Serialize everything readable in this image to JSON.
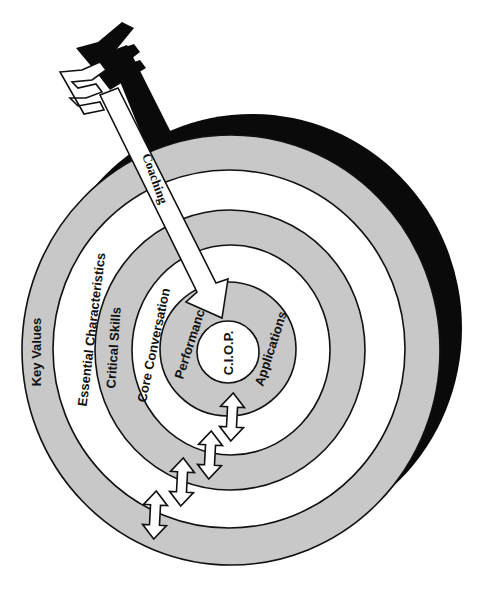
{
  "diagram": {
    "type": "target / bullseye",
    "colors": {
      "ring_gray": "#c8c8c8",
      "ring_white": "#ffffff",
      "outline": "#111111",
      "shadow": "#0a0a0a",
      "background": "#ffffff"
    },
    "rings": [
      {
        "label": "Key Values",
        "fill": "gray"
      },
      {
        "label": "Essential Characteristics",
        "fill": "white"
      },
      {
        "label": "Critical Skills",
        "fill": "gray"
      },
      {
        "label": "Core Conversation",
        "fill": "white"
      },
      {
        "label": "Performance",
        "fill": "gray"
      },
      {
        "label": "Applications",
        "fill": "gray"
      }
    ],
    "center": {
      "label": "C.I.O.P."
    },
    "arrow": {
      "label": "Coaching"
    },
    "connectors": [
      {
        "name": "bidirectional-arrow",
        "between": "Applications / Core Conversation"
      },
      {
        "name": "bidirectional-arrow",
        "between": "Core Conversation / Critical Skills"
      },
      {
        "name": "bidirectional-arrow",
        "between": "Critical Skills / Essential Characteristics"
      },
      {
        "name": "bidirectional-arrow",
        "between": "Essential Characteristics / Key Values"
      }
    ]
  }
}
